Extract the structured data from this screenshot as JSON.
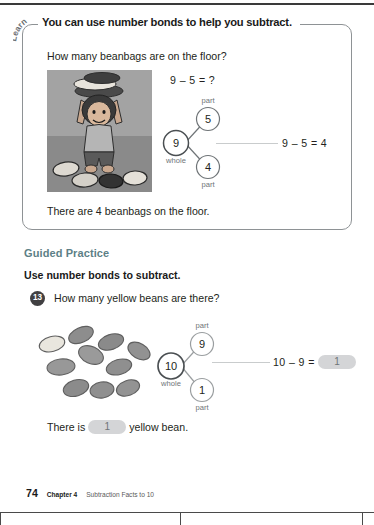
{
  "page": {
    "footer": {
      "page_number": "74",
      "chapter": "Chapter 4",
      "chapter_title": "Subtraction Facts to 10"
    }
  },
  "learn_section": {
    "tag_label": "Learn",
    "title": "You can use number bonds to help you subtract.",
    "question": "How many beanbags are on the floor?",
    "equation": "9 – 5 = ?",
    "result_equation": "9 – 5 = 4",
    "answer_sentence": "There are 4 beanbags on the floor.",
    "photo_alt": "girl-holding-beanbags-illustration",
    "number_bond": {
      "whole_value": "9",
      "whole_label": "whole",
      "part_top_value": "5",
      "part_top_label": "part",
      "part_bottom_value": "4",
      "part_bottom_label": "part"
    }
  },
  "guided_practice": {
    "heading": "Guided Practice",
    "instruction": "Use number bonds to subtract.",
    "question_number": "13",
    "question": "How many yellow beans are there?",
    "beans_alt": "ten-beans-one-yellow-illustration",
    "number_bond": {
      "whole_value": "10",
      "whole_label": "whole",
      "part_top_value": "9",
      "part_top_label": "part",
      "part_bottom_value": "1",
      "part_bottom_label": "part"
    },
    "equation_prefix": "10 – 9 =",
    "equation_answer": "1",
    "final_sentence_before": "There is",
    "final_sentence_answer": "1",
    "final_sentence_after": "yellow bean."
  },
  "colors": {
    "accent_heading": "#5d7f86",
    "blank_fill": "#d4d5d7",
    "bond_stroke": "#6f7477",
    "badge_bg": "#414042"
  }
}
